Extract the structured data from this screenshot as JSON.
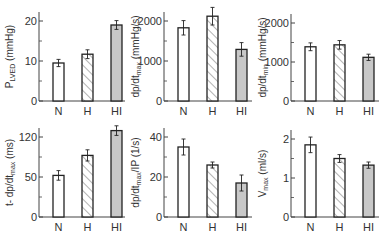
{
  "chart_data": [
    {
      "type": "bar",
      "title": "",
      "ylabel": "P_LVED (mmHg)",
      "ylabel_main": "P",
      "ylabel_sub": "LVED",
      "ylabel_tail": " (mmHg)",
      "xlabel": "",
      "categories": [
        "N",
        "H",
        "HI"
      ],
      "values": [
        9.5,
        11.7,
        19.0
      ],
      "errors": [
        0.9,
        1.1,
        1.1
      ],
      "ylim": [
        0,
        22
      ],
      "yticks": [
        0,
        10,
        20
      ],
      "ytick_labels": [
        "0",
        "10",
        "20"
      ],
      "minor_ticks": [
        5,
        15
      ],
      "fills": [
        "white",
        "hatched",
        "gray"
      ],
      "grid": false
    },
    {
      "type": "bar",
      "title": "",
      "ylabel": "dp/dt_max (mmHg/s)",
      "ylabel_main": "dp/dt",
      "ylabel_sub": "max",
      "ylabel_tail": " (mmHg/s)",
      "xlabel": "",
      "categories": [
        "N",
        "H",
        "HI"
      ],
      "values": [
        1830,
        2120,
        1290
      ],
      "errors": [
        180,
        220,
        170
      ],
      "ylim": [
        0,
        2300
      ],
      "yticks": [
        0,
        1000,
        2000
      ],
      "ytick_labels": [
        "0",
        "1000",
        "2000"
      ],
      "minor_ticks": [
        500,
        1500
      ],
      "fills": [
        "white",
        "hatched",
        "gray"
      ],
      "grid": false
    },
    {
      "type": "bar",
      "title": "",
      "ylabel": "dp/dt_min (mmHg/s)",
      "ylabel_main": "dp/dt",
      "ylabel_sub": "min",
      "ylabel_tail": " (mmHg/s)",
      "xlabel": "",
      "categories": [
        "N",
        "H",
        "HI"
      ],
      "values": [
        1390,
        1440,
        1120
      ],
      "errors": [
        100,
        110,
        80
      ],
      "ylim": [
        0,
        2300
      ],
      "yticks": [
        0,
        1000,
        2000
      ],
      "ytick_labels": [
        "0",
        "1000",
        "2000"
      ],
      "minor_ticks": [
        500,
        1500
      ],
      "fills": [
        "white",
        "hatched",
        "gray"
      ],
      "grid": false
    },
    {
      "type": "bar",
      "title": "",
      "ylabel": "t-dp/dt_max (ms)",
      "ylabel_main": "t- dp/dt",
      "ylabel_sub": "max",
      "ylabel_tail": " (ms)",
      "xlabel": "",
      "categories": [
        "N",
        "H",
        "HI"
      ],
      "values": [
        52,
        77,
        108
      ],
      "errors": [
        6,
        7,
        6
      ],
      "ylim": [
        0,
        125
      ],
      "yticks": [
        0,
        50,
        100
      ],
      "ytick_labels": [
        "0",
        "50",
        "120"
      ],
      "minor_ticks": [
        25,
        75
      ],
      "fills": [
        "white",
        "hatched",
        "gray"
      ],
      "grid": false
    },
    {
      "type": "bar",
      "title": "",
      "ylabel": "dp/dt_max/IP (1/s)",
      "ylabel_main": "dp/dt",
      "ylabel_sub": "max",
      "ylabel_tail": "/IP (1/s)",
      "xlabel": "",
      "categories": [
        "N",
        "H",
        "HI"
      ],
      "values": [
        35,
        26,
        17
      ],
      "errors": [
        4,
        1.5,
        4
      ],
      "ylim": [
        0,
        45
      ],
      "yticks": [
        0,
        20,
        40
      ],
      "ytick_labels": [
        "0",
        "20",
        "40"
      ],
      "minor_ticks": [
        10,
        30
      ],
      "fills": [
        "white",
        "hatched",
        "gray"
      ],
      "grid": false
    },
    {
      "type": "bar",
      "title": "",
      "ylabel": "V_max (ml/s)",
      "ylabel_main": "V",
      "ylabel_sub": "max",
      "ylabel_tail": " (ml/s)",
      "xlabel": "",
      "categories": [
        "N",
        "H",
        "HI"
      ],
      "values": [
        1.85,
        1.5,
        1.33
      ],
      "errors": [
        0.2,
        0.1,
        0.08
      ],
      "ylim": [
        0,
        2.3
      ],
      "yticks": [
        0,
        1,
        2
      ],
      "ytick_labels": [
        "0",
        "1",
        "2"
      ],
      "minor_ticks": [
        0.5,
        1.5
      ],
      "fills": [
        "white",
        "hatched",
        "gray"
      ],
      "grid": false
    }
  ],
  "colors": {
    "axis": "#444444",
    "bar_edge": "#222222",
    "gray_fill": "#c8c8c8",
    "hatch": "#666666",
    "text": "#333333"
  }
}
